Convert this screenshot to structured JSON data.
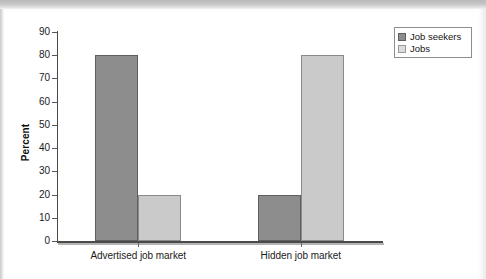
{
  "chart_data": {
    "type": "bar",
    "title": "",
    "subtitle": "",
    "xlabel": "",
    "ylabel": "Percent",
    "ylim": [
      0,
      90
    ],
    "ytick_step": 10,
    "yticks": [
      "90",
      "80",
      "70",
      "60",
      "50",
      "40",
      "30",
      "20",
      "10",
      "0"
    ],
    "grid": false,
    "legend_position": "top-right",
    "categories": [
      "Advertised job market",
      "Hidden job market"
    ],
    "series": [
      {
        "name": "Job seekers",
        "values": [
          80,
          20
        ],
        "color": "#8d8d8d"
      },
      {
        "name": "Jobs",
        "values": [
          20,
          80
        ],
        "color": "#cacaca"
      }
    ]
  },
  "legend": {
    "items": [
      {
        "label": "Job seekers"
      },
      {
        "label": "Jobs"
      }
    ]
  },
  "axis": {
    "y_title": "Percent",
    "y_tick_labels": [
      "90",
      "80",
      "70",
      "60",
      "50",
      "40",
      "30",
      "20",
      "10",
      "0"
    ],
    "x_tick_labels": [
      "Advertised job market",
      "Hidden job market"
    ]
  },
  "colors": {
    "series_job_seekers": "#8d8d8d",
    "series_jobs": "#cacaca",
    "axis": "#4a4a4a",
    "text": "#1a1a1a",
    "background": "#ffffff"
  }
}
